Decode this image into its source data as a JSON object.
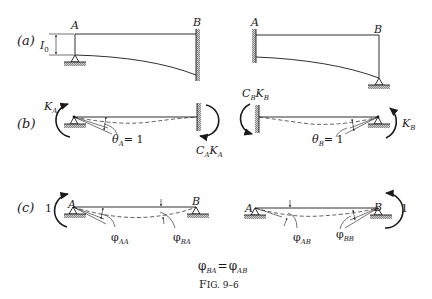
{
  "figure": {
    "caption": "Fig. 9–6",
    "caption_prefix": "F",
    "caption_rest": "IG. 9–6",
    "equation": {
      "lhs_symbol": "φ",
      "lhs_sub": "BA",
      "eq": "=",
      "rhs_symbol": "φ",
      "rhs_sub": "AB"
    }
  },
  "panels": {
    "a": {
      "label": "(a)",
      "left": {
        "node_left": "A",
        "node_right": "B",
        "dimension": {
          "symbol": "I",
          "sub": "0"
        }
      },
      "right": {
        "node_left": "A",
        "node_right": "B"
      }
    },
    "b": {
      "label": "(b)",
      "left": {
        "moment_applied": {
          "symbol": "K",
          "sub": "A"
        },
        "rotation": {
          "symbol": "θ",
          "sub": "A",
          "value": "= 1"
        },
        "carryover": {
          "c": "C",
          "c_sub": "A",
          "k": "K",
          "k_sub": "A"
        }
      },
      "right": {
        "carryover": {
          "c": "C",
          "c_sub": "B",
          "k": "K",
          "k_sub": "B"
        },
        "rotation": {
          "symbol": "θ",
          "sub": "B",
          "value": "= 1"
        },
        "moment_applied": {
          "symbol": "K",
          "sub": "B"
        }
      }
    },
    "c": {
      "label": "(c)",
      "left": {
        "unit_moment": "1",
        "node_left": "A",
        "node_right": "B",
        "angle_left": {
          "symbol": "φ",
          "sub": "AA"
        },
        "angle_right": {
          "symbol": "φ",
          "sub": "BA"
        }
      },
      "right": {
        "unit_moment": "1",
        "node_left": "A",
        "node_right": "B",
        "angle_left": {
          "symbol": "φ",
          "sub": "AB"
        },
        "angle_right": {
          "symbol": "φ",
          "sub": "BB"
        }
      }
    }
  },
  "colors": {
    "ink": "#1a1a1a",
    "background": "#ffffff"
  }
}
